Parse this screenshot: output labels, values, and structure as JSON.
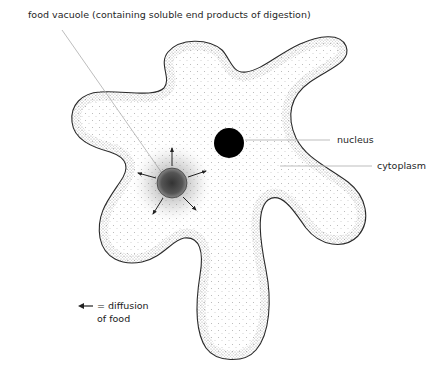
{
  "diagram": {
    "labels": {
      "food_vacuole": "food vacuole (containing soluble end products of digestion)",
      "nucleus": "nucleus",
      "cytoplasm": "cytoplasm"
    },
    "legend": {
      "symbol": "arrow-left",
      "line1": "= diffusion",
      "line2": "of food"
    },
    "colors": {
      "outline": "#2a2a2a",
      "stipple": "#555555",
      "nucleus": "#000000",
      "leader_line": "#b5b5b5",
      "text": "#1f1f1f"
    }
  }
}
